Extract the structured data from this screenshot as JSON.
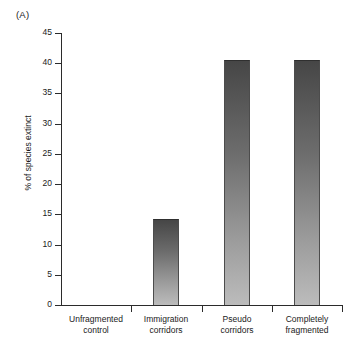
{
  "panel": {
    "label": "(A)"
  },
  "chart_data": {
    "type": "bar",
    "title": "",
    "subtitle": "",
    "xlabel": "",
    "ylabel": "% of species extinct",
    "ylim": [
      0,
      45
    ],
    "ytick_step": 5,
    "yticks": [
      "45",
      "40",
      "35",
      "30",
      "25",
      "20",
      "15",
      "10",
      "5",
      "0"
    ],
    "ytick_values": [
      45,
      40,
      35,
      30,
      25,
      20,
      15,
      10,
      5,
      0
    ],
    "grid": false,
    "legend": null,
    "categories": [
      "Unfragmented control",
      "Immigration corridors",
      "Pseudo corridors",
      "Completely fragmented"
    ],
    "category_lines": [
      [
        "Unfragmented",
        "control"
      ],
      [
        "Immigration",
        "corridors"
      ],
      [
        "Pseudo",
        "corridors"
      ],
      [
        "Completely",
        "fragmented"
      ]
    ],
    "values": [
      0,
      14.2,
      40.6,
      40.6
    ],
    "bar_fill_top": "#464646",
    "bar_fill_bottom": "#bcbcbc",
    "axis_color": "#2b2b2b"
  }
}
